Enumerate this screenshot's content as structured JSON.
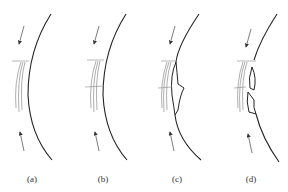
{
  "figure": {
    "panels": [
      {
        "id": "a",
        "label": "(a)",
        "description": "curved surface with thin peeling layers, no crack"
      },
      {
        "id": "b",
        "label": "(b)",
        "description": "layers with transverse crack line"
      },
      {
        "id": "c",
        "label": "(c)",
        "description": "single buckled delamination flake"
      },
      {
        "id": "d",
        "label": "(d)",
        "description": "two buckled delamination flakes"
      }
    ],
    "arrows": "compressive load arrows above and below each panel pointing toward the layered region",
    "colors": {
      "line": "#222222",
      "layer": "#777777",
      "background": "#ffffff"
    }
  }
}
